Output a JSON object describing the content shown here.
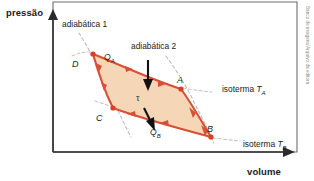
{
  "figure": {
    "type": "pv-diagram",
    "axes": {
      "y_label": "pressão",
      "x_label": "volume"
    },
    "curve_labels": {
      "adiabatic_1": "adiabática 1",
      "adiabatic_2": "adiabática 2",
      "isotherm_a_prefix": "isoterma ",
      "isotherm_a_symbol": "T",
      "isotherm_a_sub": "A",
      "isotherm_b_prefix": "isoterma ",
      "isotherm_b_symbol": "T",
      "isotherm_b_sub": "B"
    },
    "states": [
      {
        "name": "A",
        "label": "A",
        "x": 181,
        "y": 89
      },
      {
        "name": "B",
        "label": "B",
        "x": 211,
        "y": 137
      },
      {
        "name": "C",
        "label": "C",
        "x": 113,
        "y": 108
      },
      {
        "name": "D",
        "label": "D",
        "x": 93,
        "y": 54
      }
    ],
    "annotations": {
      "heat_in_symbol": "Q",
      "heat_in_sub": "A",
      "heat_out_symbol": "Q",
      "heat_out_sub": "B",
      "work_symbol": "τ"
    },
    "colors": {
      "cycle_stroke": "#d94f36",
      "cycle_fill": "#f3d2b0",
      "node": "#e03b24",
      "axis": "#2b2b2b",
      "dashed_curve": "#b9b9b9",
      "text": "#1c1c1c",
      "credit": "#8a8a8a"
    }
  },
  "credit": {
    "text": "Banco de imagens/Arquivo da editora"
  }
}
